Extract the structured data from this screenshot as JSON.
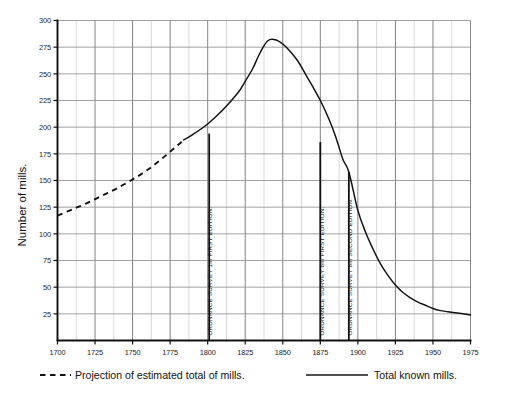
{
  "chart_data": {
    "type": "line",
    "title": "",
    "xlabel": "",
    "ylabel": "Number of mills.",
    "xlim": [
      1700,
      1975
    ],
    "ylim": [
      0,
      300
    ],
    "grid": true,
    "x_ticks": [
      1700,
      1725,
      1750,
      1775,
      1800,
      1825,
      1850,
      1875,
      1900,
      1925,
      1950,
      1975
    ],
    "x_tick_labels": [
      "1700",
      "1725",
      "1750",
      "1775",
      "1800",
      "1825",
      "1850",
      "1875",
      "1900",
      "1925",
      "1950",
      "1975"
    ],
    "y_ticks": [
      25,
      50,
      75,
      100,
      125,
      150,
      175,
      200,
      225,
      250,
      275,
      300
    ],
    "y_tick_labels": [
      "25",
      "50",
      "75",
      "100",
      "125",
      "150",
      "175",
      "200",
      "225",
      "250",
      "275",
      "300"
    ],
    "minor_x_step": 12.5,
    "series": [
      {
        "name": "Projection of estimated total of mills.",
        "style": "dashed",
        "color": "#141414",
        "x": [
          1700,
          1710,
          1720,
          1730,
          1740,
          1750,
          1760,
          1770,
          1780,
          1784
        ],
        "values": [
          117,
          123,
          129,
          136,
          143,
          151,
          160,
          171,
          183,
          188
        ]
      },
      {
        "name": "Total known mills.",
        "style": "solid",
        "color": "#141414",
        "x": [
          1784,
          1790,
          1800,
          1810,
          1820,
          1825,
          1830,
          1835,
          1840,
          1845,
          1850,
          1855,
          1860,
          1865,
          1870,
          1875,
          1880,
          1885,
          1890,
          1894,
          1900,
          1905,
          1910,
          1915,
          1920,
          1925,
          1930,
          1935,
          1940,
          1945,
          1950,
          1955,
          1960,
          1965,
          1970,
          1975
        ],
        "values": [
          188,
          193,
          203,
          216,
          232,
          243,
          255,
          270,
          281,
          282,
          278,
          271,
          262,
          250,
          238,
          225,
          210,
          192,
          170,
          158,
          122,
          102,
          86,
          72,
          61,
          52,
          45,
          40,
          36,
          33,
          30,
          28,
          27,
          26,
          25,
          24
        ]
      }
    ],
    "annotations": [
      {
        "text": "ORDNANCE SURVEY 1in FIRST EDITION.",
        "x": 1801,
        "y_top": 194,
        "orientation": "vertical"
      },
      {
        "text": "ORDNANCE SURVEY 6in FIRST EDITION.",
        "x": 1875,
        "y_top": 186,
        "orientation": "vertical"
      },
      {
        "text": "ORDNANCE SURVEY 6in SECOND EDITION.",
        "x": 1894,
        "y_top": 158,
        "orientation": "vertical"
      }
    ],
    "legend": {
      "position": "bottom",
      "entries": [
        {
          "label": "Projection of estimated total of mills.",
          "style": "dashed"
        },
        {
          "label": "Total known mills.",
          "style": "solid"
        }
      ]
    }
  }
}
